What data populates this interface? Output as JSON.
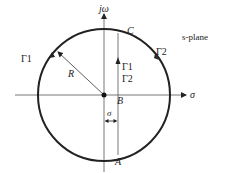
{
  "diagram": {
    "title": "s-plane",
    "axes": {
      "imag_label": "jω",
      "real_label": "σ"
    },
    "points": {
      "A": "A",
      "B": "B",
      "C": "C"
    },
    "contours": {
      "left_arc": "Γ1",
      "right_arc": "Γ2",
      "line_upper": "Γ1",
      "line_lower": "Γ2"
    },
    "radius_label": "R",
    "offset_label": "σ",
    "colors": {
      "stroke": "#222222",
      "axis": "#555555",
      "background": "#ffffff"
    }
  }
}
